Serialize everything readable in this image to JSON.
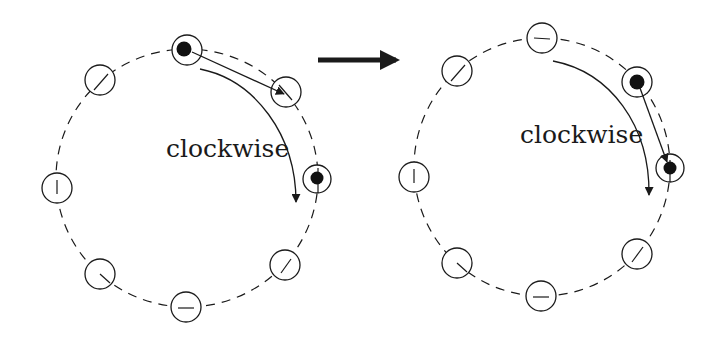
{
  "colors": {
    "stroke": "#1a1a1a",
    "background": "#ffffff",
    "particle": "#111111"
  },
  "panels": [
    {
      "name": "before",
      "label": "clockwise",
      "label_pos": [
        166,
        157
      ],
      "ring": {
        "cx": 187,
        "cy": 178,
        "r": 130
      },
      "nodes": [
        {
          "pos": "top",
          "x": 187,
          "y": 50,
          "filled": true
        },
        {
          "pos": "upper-right",
          "x": 286,
          "y": 92,
          "filled": false
        },
        {
          "pos": "right",
          "x": 317,
          "y": 179,
          "filled": true
        },
        {
          "pos": "lower-right",
          "x": 285,
          "y": 265,
          "filled": false
        },
        {
          "pos": "bottom",
          "x": 186,
          "y": 307,
          "filled": false
        },
        {
          "pos": "lower-left",
          "x": 100,
          "y": 274,
          "filled": false
        },
        {
          "pos": "left",
          "x": 57,
          "y": 188,
          "filled": false
        },
        {
          "pos": "upper-left",
          "x": 100,
          "y": 80,
          "filled": false
        }
      ]
    },
    {
      "name": "after",
      "label": "clockwise",
      "label_pos": [
        520,
        143
      ],
      "ring": {
        "cx": 542,
        "cy": 167,
        "r": 128
      },
      "nodes": [
        {
          "pos": "top",
          "x": 542,
          "y": 38,
          "filled": false
        },
        {
          "pos": "upper-right",
          "x": 637,
          "y": 82,
          "filled": true
        },
        {
          "pos": "right",
          "x": 670,
          "y": 168,
          "filled": true
        },
        {
          "pos": "lower-right",
          "x": 637,
          "y": 254,
          "filled": false
        },
        {
          "pos": "bottom",
          "x": 541,
          "y": 296,
          "filled": false
        },
        {
          "pos": "lower-left",
          "x": 457,
          "y": 263,
          "filled": false
        },
        {
          "pos": "left",
          "x": 414,
          "y": 177,
          "filled": false
        },
        {
          "pos": "upper-left",
          "x": 457,
          "y": 71,
          "filled": false
        }
      ]
    }
  ],
  "transition_arrow": {
    "from": [
      318,
      60
    ],
    "to": [
      398,
      60
    ],
    "meaning": "transition"
  }
}
